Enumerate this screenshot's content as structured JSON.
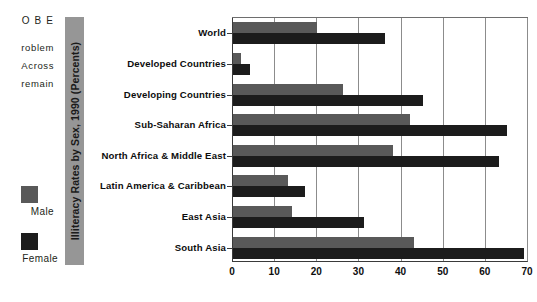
{
  "left_text": {
    "heading": "O B E",
    "lines": [
      "roblem",
      "Across",
      "remain"
    ]
  },
  "legend": {
    "items": [
      {
        "label": "Male",
        "color": "#595959",
        "swatch": "male-swatch"
      },
      {
        "label": "Female",
        "color": "#1c1c1c",
        "swatch": "female-swatch"
      }
    ]
  },
  "axis_band": {
    "title": "Illiteracy Rates by Sex, 1990 (Percents)",
    "color": "#969696"
  },
  "chart_data": {
    "type": "bar",
    "orientation": "horizontal",
    "title": "Illiteracy Rates by Sex, 1990 (Percents)",
    "xlabel": "",
    "ylabel": "",
    "xlim": [
      0,
      70
    ],
    "xticks": [
      0,
      10,
      20,
      30,
      40,
      50,
      60,
      70
    ],
    "grid": true,
    "legend_position": "left",
    "categories": [
      "World",
      "Developed Countries",
      "Developing Countries",
      "Sub-Saharan Africa",
      "North Africa & Middle East",
      "Latin America & Caribbean",
      "East Asia",
      "South Asia"
    ],
    "series": [
      {
        "name": "Male",
        "color": "#595959",
        "values": [
          20,
          2,
          26,
          42,
          38,
          13,
          14,
          43
        ]
      },
      {
        "name": "Female",
        "color": "#1c1c1c",
        "values": [
          36,
          4,
          45,
          65,
          63,
          17,
          31,
          69
        ]
      }
    ]
  }
}
